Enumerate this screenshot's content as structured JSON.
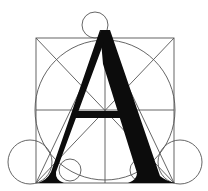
{
  "diagram": {
    "title": "Geometric construction of the letter A",
    "letter": "A",
    "colors": {
      "background": "#ffffff",
      "guide_lines": "#555555",
      "glyph": "#0c0c0c"
    },
    "elements": [
      "square",
      "inscribed-circle",
      "diagonals",
      "vertical-center-line",
      "horizontal-center-line",
      "apex-circle",
      "left-outer-circle",
      "right-outer-circle",
      "left-inner-circle",
      "right-inner-circle",
      "letter-A-glyph"
    ]
  }
}
